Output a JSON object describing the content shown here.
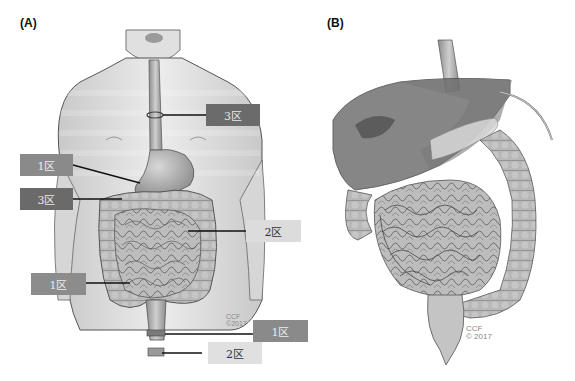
{
  "panels": [
    {
      "id": "A",
      "label": "(A)"
    },
    {
      "id": "B",
      "label": "(B)"
    }
  ],
  "zone_labels": [
    {
      "text": "3区",
      "tone": "dark",
      "color": "#6b6b6b"
    },
    {
      "text": "1区",
      "tone": "mid",
      "color": "#8a8a8a"
    },
    {
      "text": "3区",
      "tone": "dark",
      "color": "#6a6a6a"
    },
    {
      "text": "2区",
      "tone": "light",
      "color": "#dcdcdc"
    },
    {
      "text": "1区",
      "tone": "mid",
      "color": "#8c8c8c"
    },
    {
      "text": "1区",
      "tone": "mid",
      "color": "#8a8a8a"
    },
    {
      "text": "2区",
      "tone": "light",
      "color": "#e0e0e0"
    }
  ],
  "watermarks": {
    "a_line1": "CCF",
    "a_line2": "©2017",
    "b_line1": "CCF",
    "b_line2": "© 2017"
  }
}
